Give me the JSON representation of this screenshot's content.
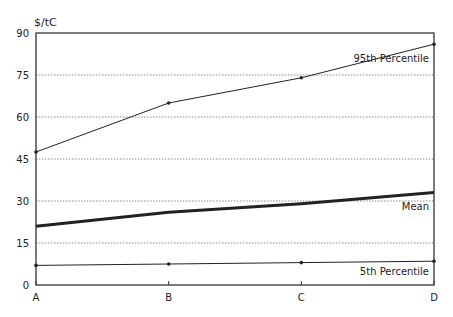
{
  "chart_data": {
    "type": "line",
    "title": "",
    "ylabel": "$/tC",
    "xlabel": "",
    "categories": [
      "A",
      "B",
      "C",
      "D"
    ],
    "yticks": [
      0,
      15,
      30,
      45,
      60,
      75,
      90
    ],
    "ylim": [
      0,
      90
    ],
    "grid": "horizontal dotted",
    "legend": "inline labels",
    "series": [
      {
        "name": "95th Percentile",
        "values": [
          47.5,
          65,
          74,
          86
        ],
        "stroke_width": 1
      },
      {
        "name": "Mean",
        "values": [
          21,
          26,
          29,
          33
        ],
        "stroke_width": 3
      },
      {
        "name": "5th Percentile",
        "values": [
          7,
          7.5,
          8,
          8.5
        ],
        "stroke_width": 1
      }
    ]
  }
}
